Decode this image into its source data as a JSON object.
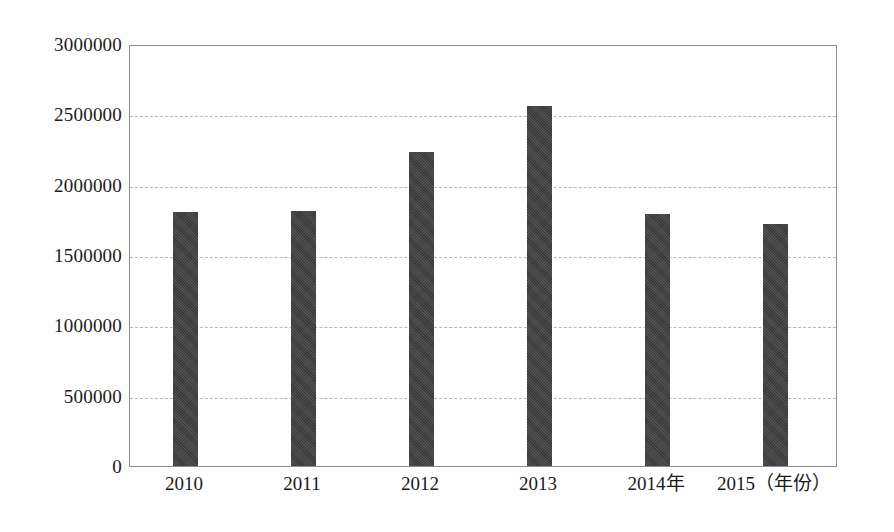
{
  "chart_data": {
    "type": "bar",
    "title": "",
    "subtitle": "",
    "xlabel": "年份",
    "ylabel": "",
    "categories": [
      "2010",
      "2011",
      "2012",
      "2013",
      "2014年",
      "2015（年份）"
    ],
    "values": [
      1805000,
      1810000,
      2230000,
      2560000,
      1795000,
      1720000
    ],
    "ylim": [
      0,
      3000000
    ],
    "ytick_labels": [
      "0",
      "500000",
      "1000000",
      "1500000",
      "2000000",
      "2500000",
      "3000000"
    ],
    "ytick_values": [
      0,
      500000,
      1000000,
      1500000,
      2000000,
      2500000,
      3000000
    ],
    "grid": true,
    "grid_axis": "y",
    "legend": false,
    "legend_position": "none",
    "series": [
      {
        "name": "",
        "color": "#3f3f3f",
        "values": [
          1805000,
          1810000,
          2230000,
          2560000,
          1795000,
          1720000
        ]
      }
    ],
    "annotations": []
  },
  "colors": {
    "bar": "#3f3f3f",
    "gridline": "#b9b9b9",
    "axis": "#8d8d8d",
    "text": "#1b1b1b",
    "background": "#fefefe"
  }
}
